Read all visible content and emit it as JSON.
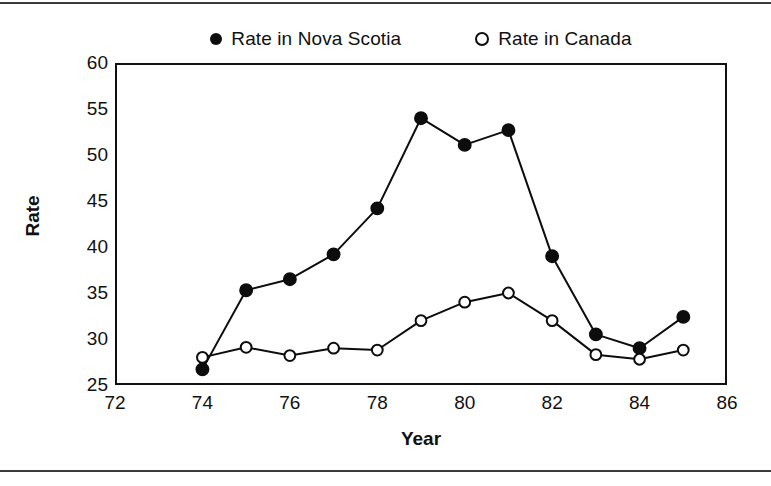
{
  "figure": {
    "name": "rate-line-chart",
    "background": "#ffffff",
    "ink_color": "#111111",
    "has_top_rule": true,
    "has_bottom_rule": true
  },
  "chart_data": {
    "type": "line",
    "title": "",
    "xlabel": "Year",
    "ylabel": "Rate",
    "xlim": [
      72,
      86
    ],
    "ylim": [
      25,
      60
    ],
    "xticks": [
      72,
      74,
      76,
      78,
      80,
      82,
      84,
      86
    ],
    "yticks": [
      25,
      30,
      35,
      40,
      45,
      50,
      55,
      60
    ],
    "grid": false,
    "legend_position": "top-center",
    "x": [
      74,
      75,
      76,
      77,
      78,
      79,
      80,
      81,
      82,
      83,
      84,
      85
    ],
    "series": [
      {
        "name": "Rate in Nova Scotia",
        "marker": "filled-circle",
        "color": "#0d0d0d",
        "values": [
          26.7,
          35.3,
          36.5,
          39.2,
          44.2,
          54.0,
          51.1,
          52.7,
          39.0,
          30.5,
          29.0,
          32.4
        ]
      },
      {
        "name": "Rate in Canada",
        "marker": "open-circle",
        "color": "#0d0d0d",
        "values": [
          28.0,
          29.1,
          28.2,
          29.0,
          28.8,
          32.0,
          34.0,
          35.0,
          32.0,
          28.3,
          27.8,
          28.8
        ]
      }
    ]
  },
  "legend": {
    "items": [
      {
        "label": "Rate in Nova Scotia",
        "marker": "filled-circle"
      },
      {
        "label": "Rate in Canada",
        "marker": "open-circle"
      }
    ]
  }
}
